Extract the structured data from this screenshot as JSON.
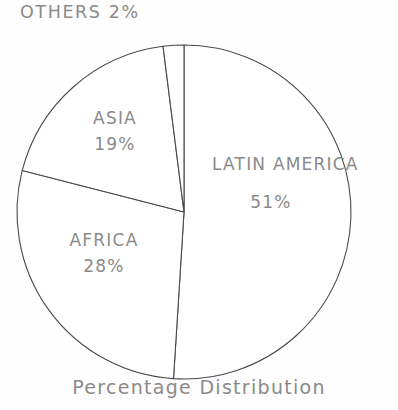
{
  "figure": {
    "caption": "Percentage Distribution",
    "background_color": "#fefefe",
    "line_color": "#4a4a4a",
    "text_color": "#8a8a8a"
  },
  "labels": {
    "others_name": "OTHERS",
    "others_value": "2%",
    "others_combined": "OTHERS 2%",
    "asia_name": "ASIA",
    "asia_value": "19%",
    "africa_name": "AFRICA",
    "africa_value": "28%",
    "latin_name": "LATIN AMERICA",
    "latin_value": "51%"
  },
  "chart_data": {
    "type": "pie",
    "title": "Percentage Distribution",
    "xlabel": "",
    "ylabel": "",
    "categories": [
      "LATIN AMERICA",
      "AFRICA",
      "ASIA",
      "OTHERS"
    ],
    "values": [
      51,
      28,
      19,
      2
    ],
    "value_labels": [
      "51%",
      "28%",
      "19%",
      "2%"
    ],
    "units": "percent",
    "total": 100,
    "start_angle_deg": 0,
    "direction": "clockwise",
    "slices": [
      {
        "label": "LATIN AMERICA",
        "value": 51,
        "value_label": "51%",
        "start_deg": 0,
        "end_deg": 183.6,
        "label_position": "inside"
      },
      {
        "label": "AFRICA",
        "value": 28,
        "value_label": "28%",
        "start_deg": 183.6,
        "end_deg": 284.4,
        "label_position": "inside"
      },
      {
        "label": "ASIA",
        "value": 19,
        "value_label": "19%",
        "start_deg": 284.4,
        "end_deg": 352.8,
        "label_position": "inside"
      },
      {
        "label": "OTHERS",
        "value": 2,
        "value_label": "2%",
        "start_deg": 352.8,
        "end_deg": 360.0,
        "label_position": "outside"
      }
    ],
    "legend": "none",
    "grid": false,
    "fill": "none",
    "geometry": {
      "center_x": 184,
      "center_y": 212,
      "radius": 167
    }
  }
}
